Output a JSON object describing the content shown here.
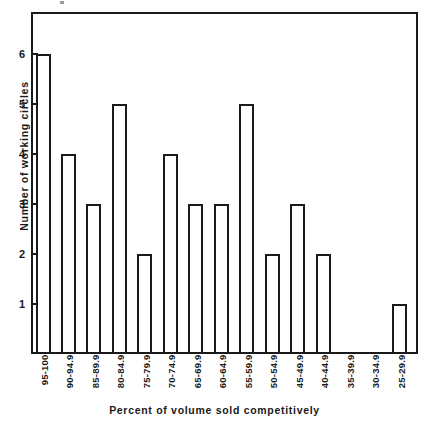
{
  "chart_data": {
    "type": "bar",
    "title": "",
    "subtitle": "",
    "xlabel": "Percent of volume sold competitively",
    "ylabel": "Number of working circles",
    "categories": [
      "95-100",
      "90-94.9",
      "85-89.9",
      "80-84.9",
      "75-79.9",
      "70-74.9",
      "65-69.9",
      "60-64.9",
      "55-59.9",
      "50-54.9",
      "45-49.9",
      "40-44.9",
      "35-39.9",
      "30-34.9",
      "25-29.9"
    ],
    "values": [
      6,
      4,
      3,
      5,
      2,
      4,
      3,
      3,
      5,
      2,
      3,
      2,
      0,
      0,
      1
    ],
    "ylim": [
      0,
      6.85
    ],
    "xlim_note": "categorical",
    "yticks": [
      1,
      2,
      3,
      4,
      5,
      6
    ],
    "ytick_labels": [
      "1",
      "2",
      "3",
      "4",
      "5",
      "6"
    ],
    "grid": false,
    "legend": false,
    "legend_position": "none",
    "bar_fill_color": "#ffffff",
    "bar_edge_color": "#1a1a1a",
    "frame_color": "#1a1a1a",
    "background_color": "#ffffff",
    "annotations": []
  },
  "axes": {
    "y_title": "Number of working circles",
    "x_title": "Percent of volume sold competitively",
    "y_ticks": [
      {
        "value": 6,
        "label": "6"
      },
      {
        "value": 5,
        "label": "5"
      },
      {
        "value": 4,
        "label": "4"
      },
      {
        "value": 3,
        "label": "3"
      },
      {
        "value": 2,
        "label": "2"
      },
      {
        "value": 1,
        "label": "1"
      }
    ]
  }
}
